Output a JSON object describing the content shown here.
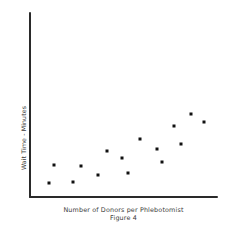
{
  "chart_data": {
    "type": "scatter",
    "title": "",
    "subtitle": "",
    "caption": "Figure 4",
    "xlabel": "Number of Donors per Phlebotomist",
    "ylabel": "Wait Time - Minutes",
    "grid": false,
    "legend": false,
    "legend_position": "none",
    "xlim": [
      0,
      100
    ],
    "ylim": [
      0,
      100
    ],
    "x_tick_labels": [],
    "y_tick_labels": [],
    "marker": "square",
    "marker_color": "#111111",
    "axis_color": "#2a2a2a",
    "background_color": "#ffffff",
    "n_points": 15,
    "points": [
      {
        "x": 10.5,
        "y": 8.0
      },
      {
        "x": 13.0,
        "y": 17.5
      },
      {
        "x": 23.5,
        "y": 8.5
      },
      {
        "x": 27.5,
        "y": 17.0
      },
      {
        "x": 36.5,
        "y": 12.5
      },
      {
        "x": 41.5,
        "y": 25.5
      },
      {
        "x": 49.0,
        "y": 21.5
      },
      {
        "x": 52.5,
        "y": 13.5
      },
      {
        "x": 58.5,
        "y": 31.5
      },
      {
        "x": 67.5,
        "y": 26.5
      },
      {
        "x": 70.5,
        "y": 19.5
      },
      {
        "x": 76.5,
        "y": 38.5
      },
      {
        "x": 80.5,
        "y": 29.0
      },
      {
        "x": 85.5,
        "y": 45.0
      },
      {
        "x": 92.5,
        "y": 41.0
      }
    ]
  }
}
